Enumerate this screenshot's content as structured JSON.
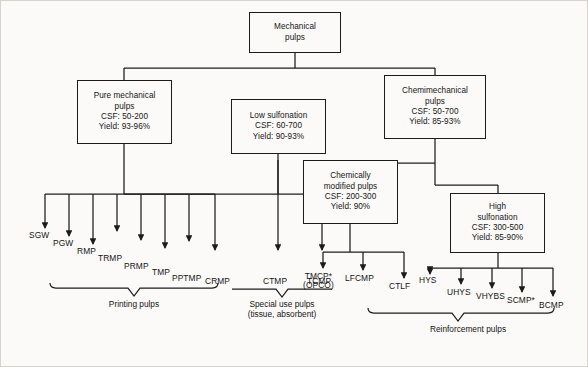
{
  "figure": {
    "type": "flowchart",
    "background_color": "#fbfaf8",
    "line_color": "#1c1c1c",
    "text_color": "#141414"
  },
  "boxes": {
    "root": {
      "title_line1": "Mechanical",
      "title_line2": "pulps"
    },
    "pure_mechanical": {
      "title_line1": "Pure mechanical",
      "title_line2": "pulps",
      "csf": "CSF: 50-200",
      "yield": "Yield: 93-96%"
    },
    "low_sulfonation": {
      "title_line1": "Low sulfonation",
      "csf": "CSF: 60-700",
      "yield": "Yield: 90-93%"
    },
    "chemimechanical": {
      "title_line1": "Chemimechanical",
      "title_line2": "pulps",
      "csf": "CSF: 50-700",
      "yield": "Yield: 85-93%"
    },
    "chemically_modified": {
      "title_line1": "Chemically",
      "title_line2": "modified pulps",
      "csf": "CSF: 200-300",
      "yield": "Yield: 90%"
    },
    "high_sulfonation": {
      "title_line1": "High",
      "title_line2": "sulfonation",
      "csf": "CSF: 300-500",
      "yield": "Yield: 85-90%"
    }
  },
  "leaves": {
    "printing": [
      {
        "label": "SGW"
      },
      {
        "label": "PGW"
      },
      {
        "label": "RMP"
      },
      {
        "label": "TRMP"
      },
      {
        "label": "PRMP"
      },
      {
        "label": "TMP"
      },
      {
        "label": "PPTMP"
      },
      {
        "label": "CRMP"
      }
    ],
    "special_use": [
      {
        "label": "CTMP"
      },
      {
        "label": "TCMP"
      }
    ],
    "reinforcement": [
      {
        "label": "TMCP*",
        "label2": "(OPCO)"
      },
      {
        "label": "LFCMP"
      },
      {
        "label": "CTLF"
      },
      {
        "label": "HYS"
      },
      {
        "label": "UHYS"
      },
      {
        "label": "VHYBS"
      },
      {
        "label": "SCMP*"
      },
      {
        "label": "BCMP"
      }
    ]
  },
  "captions": {
    "printing": "Printing pulps",
    "special_use_line1": "Special use pulps",
    "special_use_line2": "(tissue, absorbent)",
    "reinforcement": "Reinforcement pulps"
  }
}
